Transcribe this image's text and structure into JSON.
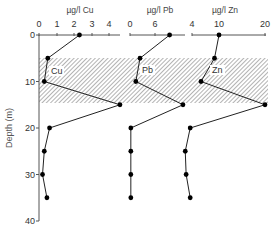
{
  "chart_data": {
    "type": "line",
    "orientation": "depth-profile",
    "ylabel": "Depth (m)",
    "y_ticks": [
      0,
      10,
      20,
      30,
      40
    ],
    "ylim": [
      0,
      40
    ],
    "y_inverted": true,
    "shaded_band": {
      "from_depth": 5,
      "to_depth": 14.5,
      "pattern": "diagonal-hatch"
    },
    "depth": [
      0,
      5,
      10,
      15,
      20,
      25,
      30,
      35
    ],
    "series": [
      {
        "name": "Cu",
        "axis_title": "µg/l Cu",
        "axis_ticks": [
          "0",
          "1",
          "2",
          "3",
          "4"
        ],
        "xlim": [
          0,
          4.5
        ],
        "values": [
          2.3,
          0.5,
          0.3,
          4.6,
          0.6,
          0.3,
          0.2,
          0.45
        ]
      },
      {
        "name": "Pb",
        "axis_title": "µg/l Pb",
        "axis_ticks": [
          "0",
          "6"
        ],
        "xlim": [
          0,
          13
        ],
        "values": [
          9.5,
          2.4,
          1.4,
          12.7,
          0.2,
          0.2,
          0.2,
          0.2
        ]
      },
      {
        "name": "Zn",
        "axis_title": "µg/l Zn",
        "axis_ticks": [
          "4",
          "10",
          "20"
        ],
        "xlim": [
          4,
          20
        ],
        "values": [
          10,
          9,
          6,
          20,
          3.6,
          2.5,
          2.7,
          3.6
        ]
      }
    ]
  }
}
